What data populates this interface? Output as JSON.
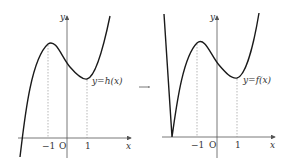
{
  "figure": {
    "left_graph": {
      "function_label": "y=h(x)",
      "axis_x_label": "x",
      "axis_y_label": "y",
      "origin_label": "O",
      "tick_labels": [
        "−1",
        "1"
      ]
    },
    "transform_arrow": "→",
    "right_graph": {
      "function_label": "y=f(x)",
      "axis_x_label": "x",
      "axis_y_label": "y",
      "origin_label": "O",
      "tick_labels": [
        "−1",
        "1"
      ]
    },
    "colors": {
      "curve": "#1a1a1a",
      "axis": "#555555",
      "dashed": "#888888",
      "text": "#333333"
    }
  }
}
